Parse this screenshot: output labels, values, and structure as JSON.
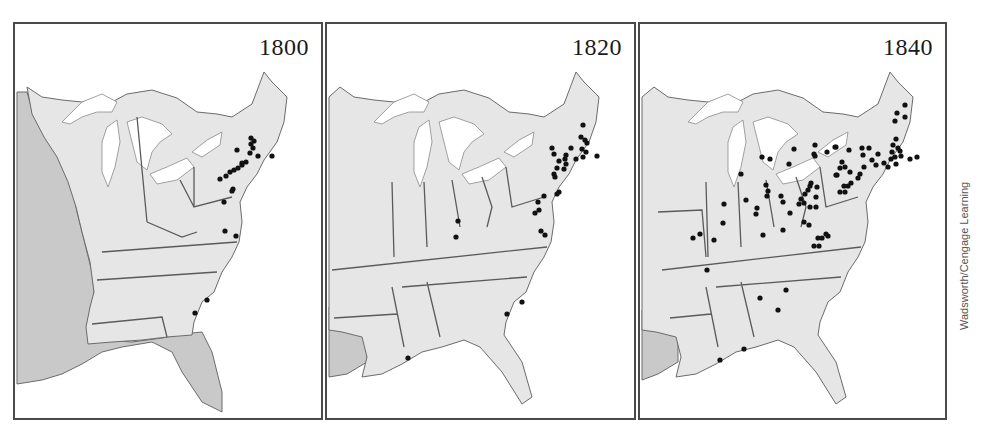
{
  "figure": {
    "credit": "Wadsworth/Cengage Learning",
    "colors": {
      "land": "#e6e6e6",
      "foreign_territory": "#c9c9c9",
      "water": "#ffffff",
      "border": "#5a5a5a",
      "dot": "#111111",
      "frame": "#4a4a4a"
    }
  },
  "panels": [
    {
      "year": "1800",
      "dots": [
        [
          249,
          136
        ],
        [
          252,
          139
        ],
        [
          249,
          142
        ],
        [
          251,
          146
        ],
        [
          248,
          151
        ],
        [
          256,
          154
        ],
        [
          235,
          148
        ],
        [
          270,
          154
        ],
        [
          244,
          160
        ],
        [
          240,
          163
        ],
        [
          236,
          166
        ],
        [
          228,
          170
        ],
        [
          224,
          174
        ],
        [
          218,
          177
        ],
        [
          232,
          168
        ],
        [
          240,
          161
        ],
        [
          231,
          187
        ],
        [
          230,
          189
        ],
        [
          222,
          200
        ],
        [
          223,
          229
        ],
        [
          234,
          234
        ],
        [
          205,
          298
        ],
        [
          193,
          311
        ]
      ]
    },
    {
      "year": "1820",
      "dots": [
        [
          581,
          123
        ],
        [
          579,
          135
        ],
        [
          583,
          138
        ],
        [
          585,
          141
        ],
        [
          580,
          147
        ],
        [
          584,
          150
        ],
        [
          569,
          146
        ],
        [
          564,
          153
        ],
        [
          550,
          146
        ],
        [
          552,
          152
        ],
        [
          595,
          154
        ],
        [
          581,
          155
        ],
        [
          574,
          157
        ],
        [
          563,
          157
        ],
        [
          557,
          159
        ],
        [
          564,
          162
        ],
        [
          555,
          166
        ],
        [
          562,
          167
        ],
        [
          552,
          172
        ],
        [
          553,
          175
        ],
        [
          557,
          190
        ],
        [
          555,
          192
        ],
        [
          542,
          194
        ],
        [
          536,
          200
        ],
        [
          537,
          208
        ],
        [
          533,
          211
        ],
        [
          539,
          229
        ],
        [
          543,
          233
        ],
        [
          456,
          219
        ],
        [
          454,
          235
        ],
        [
          520,
          300
        ],
        [
          505,
          312
        ],
        [
          406,
          356
        ]
      ]
    },
    {
      "year": "1840",
      "dots": [
        [
          903,
          103
        ],
        [
          895,
          111
        ],
        [
          903,
          115
        ],
        [
          893,
          119
        ],
        [
          894,
          137
        ],
        [
          891,
          143
        ],
        [
          896,
          146
        ],
        [
          890,
          150
        ],
        [
          898,
          149
        ],
        [
          893,
          155
        ],
        [
          899,
          154
        ],
        [
          889,
          157
        ],
        [
          882,
          161
        ],
        [
          894,
          162
        ],
        [
          908,
          157
        ],
        [
          915,
          155
        ],
        [
          886,
          165
        ],
        [
          874,
          163
        ],
        [
          870,
          158
        ],
        [
          876,
          152
        ],
        [
          860,
          146
        ],
        [
          861,
          153
        ],
        [
          867,
          146
        ],
        [
          862,
          165
        ],
        [
          858,
          172
        ],
        [
          848,
          170
        ],
        [
          843,
          165
        ],
        [
          835,
          173
        ],
        [
          856,
          176
        ],
        [
          849,
          181
        ],
        [
          842,
          184
        ],
        [
          838,
          190
        ],
        [
          846,
          184
        ],
        [
          843,
          190
        ],
        [
          833,
          145
        ],
        [
          825,
          150
        ],
        [
          812,
          152
        ],
        [
          792,
          147
        ],
        [
          813,
          143
        ],
        [
          834,
          145
        ],
        [
          847,
          148
        ],
        [
          840,
          160
        ],
        [
          838,
          166
        ],
        [
          834,
          173
        ],
        [
          813,
          154
        ],
        [
          760,
          155
        ],
        [
          768,
          157
        ],
        [
          787,
          162
        ],
        [
          779,
          194
        ],
        [
          764,
          183
        ],
        [
          809,
          181
        ],
        [
          815,
          185
        ],
        [
          803,
          192
        ],
        [
          806,
          188
        ],
        [
          808,
          184
        ],
        [
          799,
          197
        ],
        [
          781,
          200
        ],
        [
          797,
          202
        ],
        [
          802,
          201
        ],
        [
          808,
          205
        ],
        [
          814,
          205
        ],
        [
          814,
          195
        ],
        [
          802,
          220
        ],
        [
          807,
          223
        ],
        [
          824,
          232
        ],
        [
          816,
          236
        ],
        [
          812,
          244
        ],
        [
          755,
          206
        ],
        [
          754,
          212
        ],
        [
          739,
          172
        ],
        [
          788,
          211
        ],
        [
          820,
          236
        ],
        [
          826,
          234
        ],
        [
          817,
          244
        ],
        [
          781,
          228
        ],
        [
          722,
          202
        ],
        [
          766,
          189
        ],
        [
          765,
          194
        ],
        [
          721,
          221
        ],
        [
          698,
          232
        ],
        [
          744,
          198
        ],
        [
          761,
          233
        ],
        [
          691,
          236
        ],
        [
          712,
          238
        ],
        [
          705,
          268
        ],
        [
          758,
          296
        ],
        [
          784,
          288
        ],
        [
          776,
          308
        ],
        [
          742,
          347
        ],
        [
          718,
          358
        ]
      ]
    }
  ]
}
